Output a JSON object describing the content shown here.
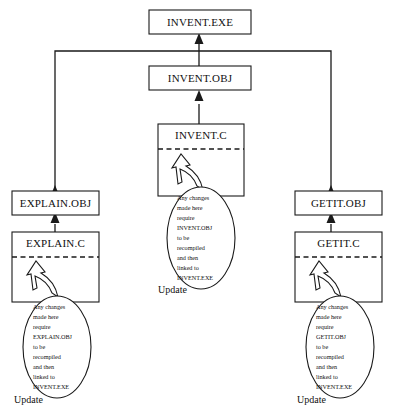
{
  "diagram": {
    "colors": {
      "background": "#ffffff",
      "stroke": "#1a1a1a",
      "text": "#111111"
    },
    "nodes": [
      {
        "id": "invent-exe",
        "label": "INVENT.EXE",
        "kind": "executable"
      },
      {
        "id": "invent-obj",
        "label": "INVENT.OBJ",
        "kind": "object"
      },
      {
        "id": "invent-c",
        "label": "INVENT.C",
        "kind": "source"
      },
      {
        "id": "explain-obj",
        "label": "EXPLAIN.OBJ",
        "kind": "object"
      },
      {
        "id": "explain-c",
        "label": "EXPLAIN.C",
        "kind": "source"
      },
      {
        "id": "getit-obj",
        "label": "GETIT.OBJ",
        "kind": "object"
      },
      {
        "id": "getit-c",
        "label": "GETIT.C",
        "kind": "source"
      }
    ],
    "balloons": [
      {
        "id": "explain-balloon",
        "lines": [
          "Any changes",
          "made here",
          "require",
          "EXPLAIN.OBJ",
          "to be",
          "recompiled",
          "and then",
          "linked to",
          "INVENT.EXE"
        ]
      },
      {
        "id": "invent-balloon",
        "lines": [
          "Any changes",
          "made here",
          "require",
          "INVENT.OBJ",
          "to be",
          "recompiled",
          "and then",
          "linked to",
          "INVENT.EXE"
        ]
      },
      {
        "id": "getit-balloon",
        "lines": [
          "Any changes",
          "made here",
          "require",
          "GETIT.OBJ",
          "to be",
          "recompiled",
          "and then",
          "linked to",
          "INVENT.EXE"
        ]
      }
    ],
    "update_labels": [
      {
        "id": "explain-update",
        "label": "Update"
      },
      {
        "id": "invent-update",
        "label": "Update"
      },
      {
        "id": "getit-update",
        "label": "Update"
      }
    ]
  }
}
